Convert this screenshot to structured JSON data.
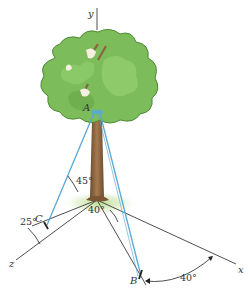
{
  "figure": {
    "axes": {
      "x": "x",
      "y": "y",
      "z": "z"
    },
    "points": {
      "A": "A",
      "B": "B",
      "C": "C"
    },
    "angles": {
      "cable_AC_elevation": "45°",
      "ground_angle_OB": "40°",
      "angle_C_from_z": "25°",
      "angle_B_from_x": "40°"
    },
    "colors": {
      "cable": "#5aa8d6",
      "axis_line": "#3a3a3a",
      "foliage": "#7cbc5a",
      "foliage_dark": "#4e8a36",
      "trunk": "#8a6440",
      "ground_glow": "#c8e0a0"
    }
  }
}
